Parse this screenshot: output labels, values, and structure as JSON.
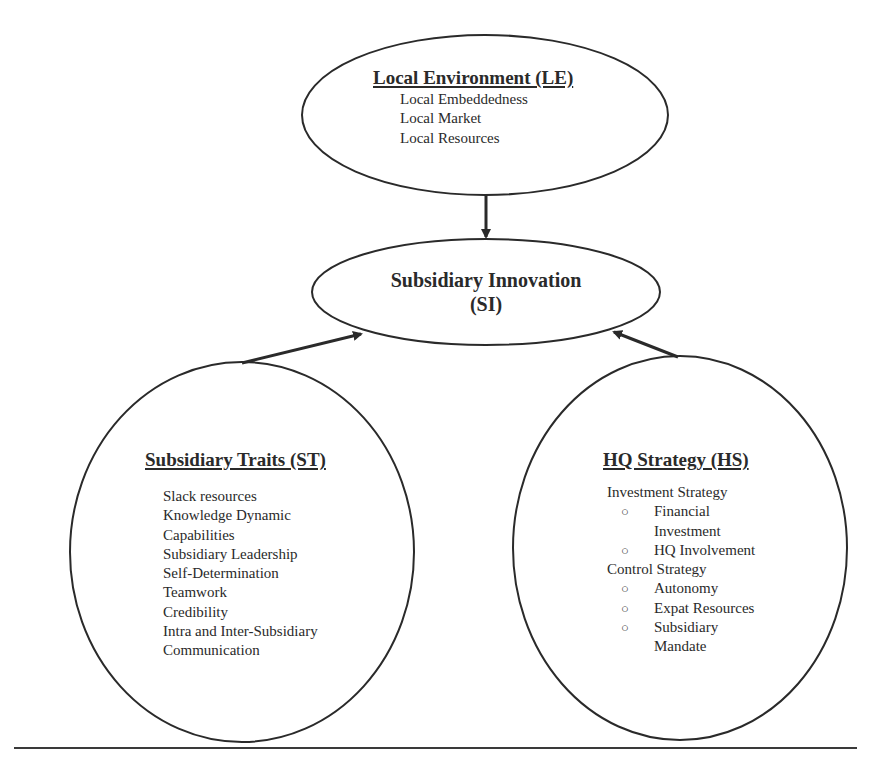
{
  "diagram": {
    "type": "conceptual-model",
    "nodes": {
      "local_environment": {
        "title": "Local Environment (LE)",
        "items": [
          "Local Embeddedness",
          "Local Market",
          "Local Resources"
        ]
      },
      "subsidiary_innovation": {
        "title_line1": "Subsidiary Innovation",
        "title_line2": "(SI)"
      },
      "subsidiary_traits": {
        "title": "Subsidiary Traits (ST)",
        "items": [
          "Slack resources",
          "Knowledge Dynamic",
          "Capabilities",
          "Subsidiary Leadership",
          "Self-Determination",
          "Teamwork",
          "Credibility",
          "Intra and Inter-Subsidiary",
          "Communication"
        ]
      },
      "hq_strategy": {
        "title": "HQ Strategy (HS)",
        "groups": [
          {
            "label": "Investment Strategy",
            "bullet": "○",
            "items": [
              "Financial Investment",
              "HQ Involvement"
            ]
          },
          {
            "label": "Control Strategy",
            "bullet": "○",
            "items": [
              "Autonomy",
              "Expat Resources",
              "Subsidiary Mandate"
            ]
          }
        ]
      }
    },
    "edges": [
      {
        "from": "Local Environment (LE)",
        "to": "Subsidiary Innovation (SI)"
      },
      {
        "from": "Subsidiary Traits (ST)",
        "to": "Subsidiary Innovation (SI)"
      },
      {
        "from": "HQ Strategy (HS)",
        "to": "Subsidiary Innovation (SI)"
      }
    ],
    "colors": {
      "stroke": "#2a2a2a",
      "background": "#ffffff"
    }
  }
}
